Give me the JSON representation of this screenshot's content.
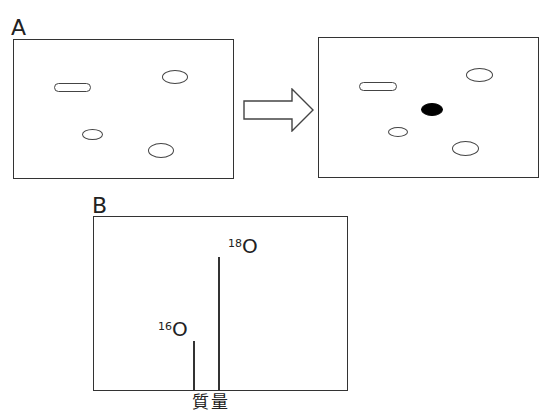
{
  "panelA": {
    "label": "A",
    "before": {
      "spots": [
        {
          "shape": "pill",
          "x": 54,
          "y": 83,
          "w": 37,
          "h": 9,
          "filled": false
        },
        {
          "shape": "ellipse",
          "x": 162,
          "y": 70,
          "w": 26,
          "h": 14,
          "filled": false
        },
        {
          "shape": "ellipse",
          "x": 82,
          "y": 129,
          "w": 21,
          "h": 11,
          "filled": false
        },
        {
          "shape": "ellipse",
          "x": 148,
          "y": 143,
          "w": 26,
          "h": 15,
          "filled": false
        }
      ]
    },
    "arrow": {
      "direction": "right",
      "style": "outline"
    },
    "after": {
      "spots": [
        {
          "shape": "pill",
          "x": 359,
          "y": 82,
          "w": 38,
          "h": 9,
          "filled": false
        },
        {
          "shape": "ellipse",
          "x": 466,
          "y": 68,
          "w": 27,
          "h": 14,
          "filled": false
        },
        {
          "shape": "ellipse",
          "x": 421,
          "y": 103,
          "w": 22,
          "h": 13,
          "filled": true
        },
        {
          "shape": "ellipse",
          "x": 388,
          "y": 127,
          "w": 20,
          "h": 10,
          "filled": false
        },
        {
          "shape": "ellipse",
          "x": 452,
          "y": 141,
          "w": 27,
          "h": 15,
          "filled": false
        }
      ]
    }
  },
  "panelB": {
    "label": "B",
    "xlabel": "質量",
    "peaks": [
      {
        "mass": "16",
        "element": "O",
        "relative_height": 0.28
      },
      {
        "mass": "18",
        "element": "O",
        "relative_height": 0.76
      }
    ]
  },
  "chart_data": {
    "type": "bar",
    "title": "",
    "xlabel": "質量",
    "ylabel": "",
    "categories": [
      "16O",
      "18O"
    ],
    "values": [
      49,
      133
    ],
    "note": "mass spectrum stick peaks; values are relative pixel heights (18O peak larger than 16O)",
    "grid": false
  }
}
